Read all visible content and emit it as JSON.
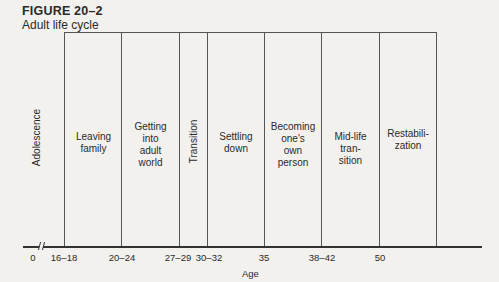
{
  "figure": {
    "number": "FIGURE 20–2",
    "title": "Adult life cycle"
  },
  "stages": [
    {
      "label": "Adolescence",
      "orientation": "vertical"
    },
    {
      "label": "Leaving\nfamily",
      "orientation": "horizontal"
    },
    {
      "label": "Getting\ninto\nadult\nworld",
      "orientation": "horizontal"
    },
    {
      "label": "Transition",
      "orientation": "vertical"
    },
    {
      "label": "Settling\ndown",
      "orientation": "horizontal"
    },
    {
      "label": "Becoming\none's\nown\nperson",
      "orientation": "horizontal"
    },
    {
      "label": "Mid-life\ntran-\nsition",
      "orientation": "horizontal"
    },
    {
      "label": "Restabili-\nzation",
      "orientation": "horizontal"
    }
  ],
  "axis": {
    "label": "Age",
    "ticks": [
      "0",
      "16–18",
      "20–24",
      "27–29",
      "30–32",
      "35",
      "38–42",
      "50"
    ]
  },
  "colors": {
    "background": "#f2f1ee",
    "lines": "#555555",
    "text": "#2a2a2a"
  }
}
